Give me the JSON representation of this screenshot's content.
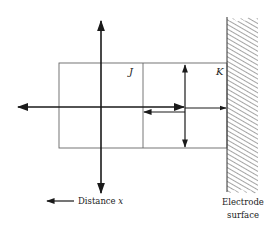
{
  "diagram": {
    "type": "electrode-interface-schematic",
    "labels": {
      "region_j": "J",
      "region_k": "K",
      "distance_prefix": "Distance ",
      "distance_var": "x",
      "electrode_line1": "Electrode",
      "electrode_line2": "surface"
    },
    "colors": {
      "line": "#1a1a1a",
      "thin_line": "#555555",
      "hatch": "#666666",
      "background": "#ffffff"
    }
  }
}
